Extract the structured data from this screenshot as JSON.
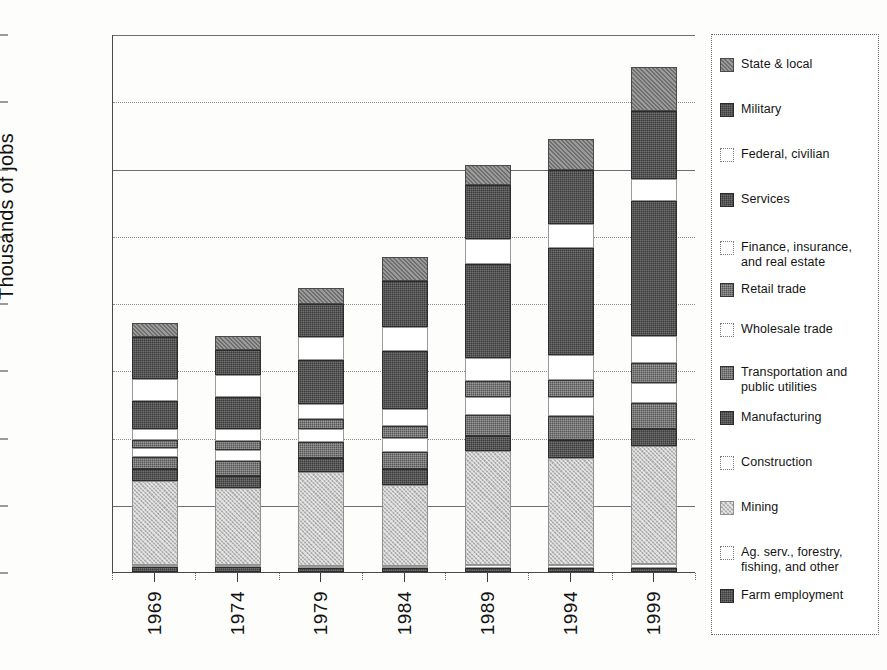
{
  "chart_data": {
    "type": "bar",
    "stacked": true,
    "title": "",
    "xlabel": "",
    "ylabel": "Thousands of jobs",
    "categories": [
      "1969",
      "1974",
      "1979",
      "1984",
      "1989",
      "1994",
      "1999"
    ],
    "ylim": [
      0,
      800
    ],
    "yticks": [
      0,
      100,
      200,
      300,
      400,
      500,
      600,
      700,
      800
    ],
    "ytick_labels": [
      "0",
      "100",
      "200",
      "300",
      "400",
      "500",
      "600",
      "700",
      "800"
    ],
    "grid": true,
    "legend_position": "right",
    "units": "thousands of jobs",
    "series": [
      {
        "name": "Farm employment",
        "fill": "dark",
        "values": [
          7,
          7,
          6,
          6,
          6,
          6,
          6
        ]
      },
      {
        "name": "Ag. serv., forestry, fishing, and other",
        "fill": "white",
        "values": [
          1,
          1,
          2,
          3,
          4,
          5,
          6
        ]
      },
      {
        "name": "Mining",
        "fill": "light",
        "values": [
          125,
          115,
          140,
          120,
          170,
          158,
          175
        ]
      },
      {
        "name": "Construction",
        "fill": "white",
        "values": [
          0,
          0,
          0,
          0,
          0,
          0,
          0
        ]
      },
      {
        "name": "Manufacturing",
        "fill": "dark",
        "values": [
          18,
          18,
          20,
          24,
          22,
          28,
          26
        ]
      },
      {
        "name": "Transportation and public utilities",
        "fill": "mid",
        "values": [
          18,
          22,
          25,
          26,
          32,
          35,
          38
        ]
      },
      {
        "name": "Wholesale trade",
        "fill": "white",
        "values": [
          14,
          16,
          18,
          20,
          26,
          28,
          30
        ]
      },
      {
        "name": "Retail trade",
        "fill": "mid",
        "values": [
          12,
          14,
          16,
          18,
          24,
          26,
          30
        ]
      },
      {
        "name": "Finance, insurance, and real estate",
        "fill": "white",
        "values": [
          16,
          18,
          22,
          26,
          34,
          36,
          40
        ]
      },
      {
        "name": "Services",
        "fill": "dark",
        "values": [
          42,
          48,
          66,
          86,
          140,
          160,
          200
        ]
      },
      {
        "name": "Federal, civilian",
        "fill": "white",
        "values": [
          32,
          32,
          34,
          36,
          38,
          36,
          34
        ]
      },
      {
        "name": "Military",
        "fill": "dark",
        "values": [
          62,
          38,
          48,
          68,
          80,
          80,
          100
        ]
      },
      {
        "name": "State & local",
        "fill": "medgray",
        "values": [
          22,
          20,
          24,
          36,
          30,
          46,
          66
        ]
      }
    ],
    "totals": [
      369,
      349,
      421,
      469,
      606,
      644,
      751
    ]
  },
  "legend": {
    "items": [
      {
        "label": "State & local",
        "swatch": "medgray"
      },
      {
        "label": "Military",
        "swatch": "dark"
      },
      {
        "label": "Federal, civilian",
        "swatch": "white"
      },
      {
        "label": "Services",
        "swatch": "dark"
      },
      {
        "label": "Finance, insurance, and real estate",
        "swatch": "white"
      },
      {
        "label": "Retail trade",
        "swatch": "mid"
      },
      {
        "label": "Wholesale trade",
        "swatch": "white"
      },
      {
        "label": "Transportation and public utilities",
        "swatch": "mid"
      },
      {
        "label": "Manufacturing",
        "swatch": "dark"
      },
      {
        "label": "Construction",
        "swatch": "white"
      },
      {
        "label": "Mining",
        "swatch": "light"
      },
      {
        "label": "Ag. serv., forestry, fishing, and other",
        "swatch": "white"
      },
      {
        "label": "Farm employment",
        "swatch": "dark"
      }
    ]
  },
  "colors": {
    "dark": "#3b3b3b",
    "mid": "#555555",
    "medgray": "#6f6f6f",
    "light": "#c6c6c6",
    "white": "#ffffff",
    "axis": "#3a3a3a",
    "grid": "#8a8a8a",
    "background": "#fdfdfb"
  }
}
